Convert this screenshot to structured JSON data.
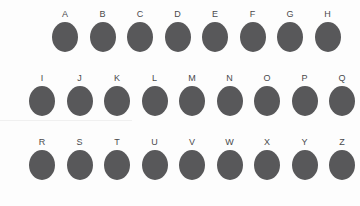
{
  "canvas": {
    "width": 360,
    "height": 206,
    "background_color": "#fdfdfd"
  },
  "style": {
    "dot_color": "#58585a",
    "label_color": "#4a4a4c",
    "dot_width": 26,
    "dot_height": 30
  },
  "rows": [
    {
      "row_index": 1,
      "start_x": 50,
      "top": 10,
      "spacing": 37.5,
      "items": [
        {
          "label": "A"
        },
        {
          "label": "B"
        },
        {
          "label": "C"
        },
        {
          "label": "D"
        },
        {
          "label": "E"
        },
        {
          "label": "F"
        },
        {
          "label": "G"
        },
        {
          "label": "H"
        }
      ]
    },
    {
      "row_index": 2,
      "start_x": 27,
      "top": 74,
      "spacing": 37.5,
      "items": [
        {
          "label": "I"
        },
        {
          "label": "J"
        },
        {
          "label": "K"
        },
        {
          "label": "L"
        },
        {
          "label": "M"
        },
        {
          "label": "N"
        },
        {
          "label": "O"
        },
        {
          "label": "P"
        },
        {
          "label": "Q"
        }
      ]
    },
    {
      "row_index": 3,
      "start_x": 27,
      "top": 138,
      "spacing": 37.5,
      "items": [
        {
          "label": "R"
        },
        {
          "label": "S"
        },
        {
          "label": "T"
        },
        {
          "label": "U"
        },
        {
          "label": "V"
        },
        {
          "label": "W"
        },
        {
          "label": "X"
        },
        {
          "label": "Y"
        },
        {
          "label": "Z"
        }
      ]
    }
  ]
}
